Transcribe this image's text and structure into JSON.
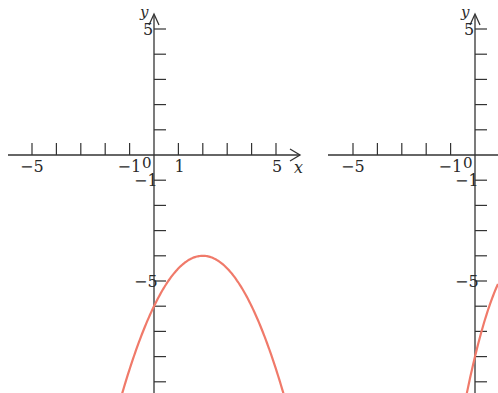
{
  "graphs": [
    {
      "id": "left",
      "origin_px": [
        154,
        155
      ],
      "unit_px": [
        24.4,
        25.2
      ],
      "x_axis": {
        "label": "x",
        "tick_labels": {
          "-5": "−5",
          "-1": "−1",
          "1": "1",
          "5": "5"
        },
        "range": [
          -6,
          6
        ]
      },
      "y_axis": {
        "label": "y",
        "tick_labels": {
          "5": "5",
          "-1": "−1",
          "-5": "−5"
        },
        "range": [
          -10,
          6
        ]
      },
      "origin_label": "0",
      "curve": {
        "type": "parabola",
        "vertex": [
          2,
          -4
        ],
        "y_intercept": -6,
        "a": -0.5,
        "color": "#f07a6a"
      }
    },
    {
      "id": "right",
      "origin_px": [
        475,
        155
      ],
      "unit_px": [
        24.4,
        25.2
      ],
      "x_axis": {
        "label": "",
        "tick_labels": {
          "-5": "−5",
          "-1": "−1"
        },
        "range": [
          -6,
          1
        ]
      },
      "y_axis": {
        "label": "y",
        "tick_labels": {
          "5": "5",
          "-1": "−1",
          "-5": "−5"
        },
        "range": [
          -10,
          6
        ]
      },
      "origin_label": "0",
      "curve": {
        "type": "parabola",
        "vertex": [
          2,
          -4
        ],
        "y_intercept": -8,
        "a": -1,
        "color": "#f07a6a"
      }
    }
  ],
  "chart_data": [
    {
      "type": "line",
      "title": "",
      "xlabel": "x",
      "ylabel": "y",
      "xlim": [
        -6,
        6
      ],
      "ylim": [
        -10,
        6
      ],
      "grid": false,
      "series": [
        {
          "name": "y = -0.5(x-2)^2 - 4",
          "x": [
            -1.4,
            -1,
            0,
            1,
            2,
            3,
            4,
            5,
            5.2
          ],
          "y": [
            -9.78,
            -8.5,
            -6,
            -4.5,
            -4,
            -4.5,
            -6,
            -8.5,
            -9.12
          ]
        }
      ]
    },
    {
      "type": "line",
      "title": "",
      "xlabel": "",
      "ylabel": "y",
      "xlim": [
        -6,
        1
      ],
      "ylim": [
        -10,
        6
      ],
      "grid": false,
      "series": [
        {
          "name": "y = -(x-2)^2 - 4",
          "x": [
            -0.2,
            0,
            0.5,
            0.9
          ],
          "y": [
            -8.84,
            -8,
            -6.25,
            -5.21
          ]
        }
      ]
    }
  ]
}
